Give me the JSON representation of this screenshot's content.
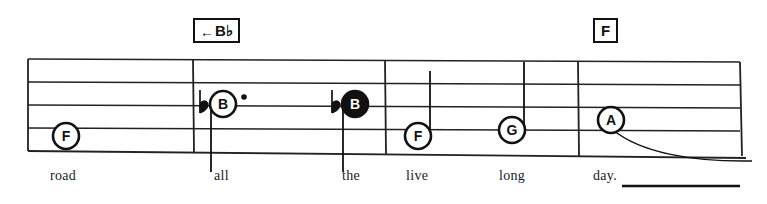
{
  "document": {
    "type": "shape-note music notation excerpt",
    "title_text": ""
  },
  "chord_boxes": [
    {
      "id": "chord-bb",
      "arrow": "←",
      "label": "B♭",
      "x": 193,
      "y": 18
    },
    {
      "id": "chord-f",
      "arrow": "",
      "label": "F",
      "x": 593,
      "y": 18
    }
  ],
  "staff": {
    "line_count": 5,
    "left": 28,
    "right": 740,
    "top": 59,
    "bottom": 152,
    "color": "#222222"
  },
  "barlines": [
    {
      "name": "barline-1",
      "x": 193
    },
    {
      "name": "barline-2",
      "x": 385
    },
    {
      "name": "barline-3",
      "x": 578
    }
  ],
  "notes": [
    {
      "name": "note-f-1",
      "letter": "F",
      "head": "hollow",
      "accidental": "",
      "dotted": false,
      "stem": "none",
      "x": 66,
      "y": 136
    },
    {
      "name": "note-b-flat-1",
      "letter": "B",
      "head": "hollow",
      "accidental": "♭",
      "dotted": true,
      "stem": "down",
      "x": 223,
      "y": 104
    },
    {
      "name": "note-b-flat-2",
      "letter": "B",
      "head": "filled",
      "accidental": "♭",
      "dotted": false,
      "stem": "down",
      "x": 355,
      "y": 104
    },
    {
      "name": "note-f-2",
      "letter": "F",
      "head": "hollow",
      "accidental": "",
      "dotted": false,
      "stem": "up",
      "x": 418,
      "y": 136
    },
    {
      "name": "note-g-1",
      "letter": "G",
      "head": "hollow",
      "accidental": "",
      "dotted": false,
      "stem": "up",
      "x": 512,
      "y": 130
    },
    {
      "name": "note-a-1",
      "letter": "A",
      "head": "hollow",
      "accidental": "",
      "dotted": false,
      "stem": "none",
      "x": 611,
      "y": 120
    }
  ],
  "lyrics": [
    {
      "name": "lyric-road",
      "text": "road",
      "x": 50,
      "y": 175
    },
    {
      "name": "lyric-all",
      "text": "all",
      "x": 214,
      "y": 175
    },
    {
      "name": "lyric-the",
      "text": "the",
      "x": 342,
      "y": 175
    },
    {
      "name": "lyric-live",
      "text": "live",
      "x": 406,
      "y": 175
    },
    {
      "name": "lyric-long",
      "text": "long",
      "x": 499,
      "y": 175
    },
    {
      "name": "lyric-day",
      "text": "day.",
      "x": 593,
      "y": 175
    }
  ],
  "melisma": {
    "name": "melisma-extension-line",
    "x1": 622,
    "x2": 740,
    "y": 186
  },
  "tie": {
    "name": "tie-slur-from-a",
    "description": "curved tie extending right and down from the A note"
  },
  "colors": {
    "ink": "#111111",
    "staff_line": "#222222",
    "paper": "#ffffff"
  }
}
